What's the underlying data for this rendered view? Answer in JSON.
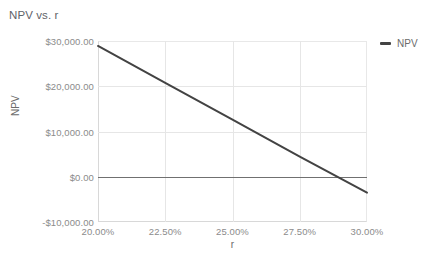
{
  "chart_data": {
    "type": "line",
    "title": "NPV vs. r",
    "xlabel": "r",
    "ylabel": "NPV",
    "xlim": [
      0.2,
      0.3
    ],
    "ylim": [
      -10000,
      30000
    ],
    "grid": true,
    "legend_position": "right",
    "xticks": [
      "20.00%",
      "22.50%",
      "25.00%",
      "27.50%",
      "30.00%"
    ],
    "xtick_values": [
      0.2,
      0.225,
      0.25,
      0.275,
      0.3
    ],
    "yticks": [
      "-$10,000.00",
      "$0.00",
      "$10,000.00",
      "$20,000.00",
      "$30,000.00"
    ],
    "ytick_values": [
      -10000,
      0,
      10000,
      20000,
      30000
    ],
    "reference_line": {
      "name": "zero-line",
      "value": 0,
      "color": "#707070"
    },
    "series": [
      {
        "name": "NPV",
        "color": "#434343",
        "x": [
          0.2,
          0.225,
          0.25,
          0.275,
          0.3
        ],
        "values": [
          28900,
          20750,
          12600,
          4450,
          -3500
        ]
      }
    ]
  },
  "legend": {
    "entries": [
      {
        "label": "NPV",
        "color": "#434343"
      }
    ]
  }
}
